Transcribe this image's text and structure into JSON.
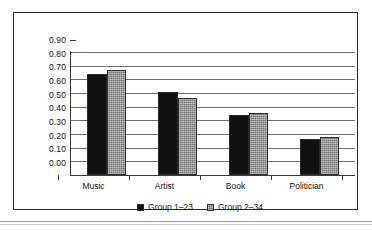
{
  "chart_data": {
    "type": "bar",
    "title": "",
    "subtitle": "",
    "xlabel": "",
    "ylabel": "",
    "categories": [
      "Music",
      "Artist",
      "Book",
      "Politician"
    ],
    "series": [
      {
        "name": "Group 1–23",
        "color": "#111111",
        "values": [
          0.74,
          0.61,
          0.44,
          0.265
        ]
      },
      {
        "name": "Group 2–34",
        "color": "#8d8d8d",
        "values": [
          0.77,
          0.56,
          0.455,
          0.275
        ]
      }
    ],
    "ylim": [
      0.0,
      0.9
    ],
    "ytick_step": 0.1,
    "ytick_labels": [
      "0.90",
      "0.80",
      "0.70",
      "0.60",
      "0.50",
      "0.40",
      "0.30",
      "0.20",
      "0.10",
      "0.00"
    ],
    "grid": true,
    "legend_position": "bottom"
  },
  "legend": {
    "entries": [
      {
        "label": "Group 1–23"
      },
      {
        "label": "Group 2–34"
      }
    ]
  }
}
